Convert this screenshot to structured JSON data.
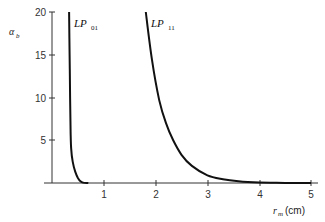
{
  "chart_data": {
    "type": "line",
    "title": "",
    "xlabel": "r_m(cm)",
    "ylabel": "α_b",
    "xlim": [
      0,
      5
    ],
    "ylim": [
      0,
      20
    ],
    "xticks": [
      1,
      2,
      3,
      4,
      5
    ],
    "yticks": [
      5,
      10,
      15,
      20
    ],
    "grid": false,
    "legend": "inline labels near curves",
    "series": [
      {
        "name": "LP01",
        "x": [
          0.33,
          0.34,
          0.35,
          0.36,
          0.37,
          0.4,
          0.45,
          0.5,
          0.55,
          0.6,
          0.7
        ],
        "y": [
          20,
          15,
          10,
          6,
          4,
          2.5,
          1.3,
          0.6,
          0.2,
          0.05,
          0
        ]
      },
      {
        "name": "LP11",
        "x": [
          1.81,
          1.93,
          2.07,
          2.2,
          2.34,
          2.5,
          2.7,
          3.0,
          3.3,
          3.6,
          4.0,
          4.5,
          5.0
        ],
        "y": [
          20,
          14.4,
          9.7,
          7.0,
          5.0,
          3.3,
          2.0,
          0.9,
          0.45,
          0.2,
          0.05,
          0.01,
          0
        ]
      }
    ],
    "annotations": [
      {
        "text": "LP01",
        "near": "LP01 curve top"
      },
      {
        "text": "LP11",
        "near": "LP11 curve top"
      }
    ]
  },
  "labels": {
    "y_axis_title": "α",
    "y_axis_sub": "b",
    "x_axis_title": "r",
    "x_axis_sub": "m",
    "x_axis_unit": "(cm)",
    "lp01_main": "LP",
    "lp01_sub": "01",
    "lp11_main": "LP",
    "lp11_sub": "11",
    "yticks": [
      "5",
      "10",
      "15",
      "20"
    ],
    "xticks": [
      "1",
      "2",
      "3",
      "4",
      "5"
    ]
  },
  "colors": {
    "curve": "#111111",
    "axis": "#333333"
  }
}
